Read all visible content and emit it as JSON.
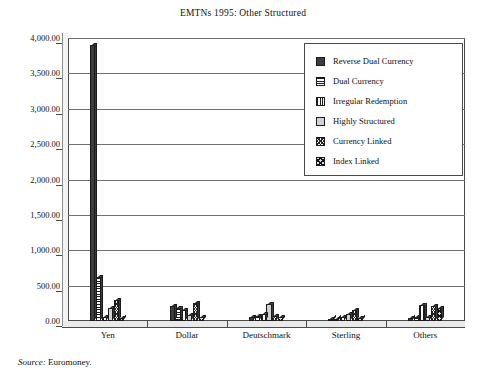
{
  "chart_data": {
    "type": "bar",
    "title": "EMTNs 1995: Other Structured",
    "xlabel": "",
    "ylabel": "",
    "ylim": [
      0,
      4000
    ],
    "ytick_step": 500,
    "grid": true,
    "legend_position": "upper right",
    "categories": [
      "Yen",
      "Dollar",
      "Deutschmark",
      "Sterling",
      "Others"
    ],
    "ytick_labels": [
      "0.00",
      "500.00",
      "1,000.00",
      "1,500.00",
      "2,000.00",
      "2,500.00",
      "3,000.00",
      "3,500.00",
      "4,000.00"
    ],
    "series": [
      {
        "name": "Reverse Dual Currency",
        "pattern": "solid-dark",
        "values": [
          3900,
          210,
          60,
          20,
          40
        ]
      },
      {
        "name": "Dual Currency",
        "pattern": "horizontal-lines",
        "values": [
          625,
          190,
          75,
          35,
          55
        ]
      },
      {
        "name": "Irregular Redemption",
        "pattern": "vertical-lines",
        "values": [
          55,
          150,
          95,
          50,
          230
        ]
      },
      {
        "name": "Highly Structured",
        "pattern": "light-gray",
        "values": [
          190,
          85,
          235,
          95,
          60
        ]
      },
      {
        "name": "Currency Linked",
        "pattern": "fine-checker",
        "values": [
          300,
          250,
          70,
          150,
          210
        ]
      },
      {
        "name": "Index Linked",
        "pattern": "coarse-checker",
        "values": [
          45,
          60,
          55,
          45,
          180
        ]
      }
    ]
  },
  "source": {
    "label": "Source:",
    "value": "Euromoney."
  }
}
